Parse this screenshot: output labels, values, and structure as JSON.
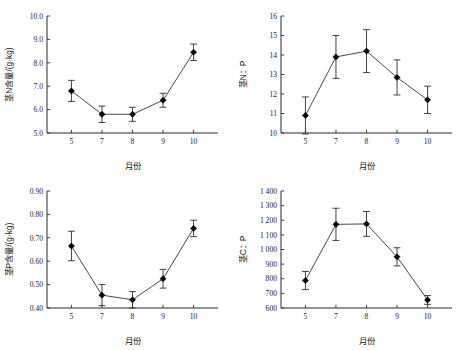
{
  "figure": {
    "title": "",
    "panel_count": 4,
    "background": "#ffffff",
    "marker_color": "#000000",
    "line_color": "#333333"
  },
  "chart_data": [
    {
      "id": "panel-1",
      "type": "line",
      "title": "",
      "xlabel": "月份",
      "ylabel": "茎N含量/(g·kg)",
      "categories": [
        "5",
        "7",
        "8",
        "9",
        "10"
      ],
      "x": [
        5,
        7,
        8,
        9,
        10
      ],
      "values": [
        6.8,
        5.8,
        5.8,
        6.4,
        8.45
      ],
      "errors": [
        0.45,
        0.35,
        0.3,
        0.3,
        0.35
      ],
      "ylim": [
        5.0,
        10.0
      ],
      "yticks": [
        5.0,
        6.0,
        7.0,
        8.0,
        9.0,
        10.0
      ],
      "ytick_labels": [
        "5.0",
        "6.0",
        "7.0",
        "8.0",
        "9.0",
        "10.0"
      ],
      "xtick_labels": [
        "5",
        "7",
        "8",
        "9",
        "10"
      ],
      "grid": false,
      "legend": "none"
    },
    {
      "id": "panel-2",
      "type": "line",
      "title": "",
      "xlabel": "月份",
      "ylabel": "茎N：P",
      "categories": [
        "5",
        "7",
        "8",
        "9",
        "10"
      ],
      "x": [
        5,
        7,
        8,
        9,
        10
      ],
      "values": [
        10.9,
        13.9,
        14.2,
        12.85,
        11.7
      ],
      "errors": [
        0.95,
        1.1,
        1.1,
        0.9,
        0.7
      ],
      "ylim": [
        10,
        16
      ],
      "yticks": [
        10,
        11,
        12,
        13,
        14,
        15,
        16
      ],
      "ytick_labels": [
        "10",
        "11",
        "12",
        "13",
        "14",
        "15",
        "16"
      ],
      "xtick_labels": [
        "5",
        "7",
        "8",
        "9",
        "10"
      ],
      "grid": false,
      "legend": "none"
    },
    {
      "id": "panel-3",
      "type": "line",
      "title": "",
      "xlabel": "月份",
      "ylabel": "茎P含量/(g·kg)",
      "categories": [
        "5",
        "7",
        "8",
        "9",
        "10"
      ],
      "x": [
        5,
        7,
        8,
        9,
        10
      ],
      "values": [
        0.665,
        0.455,
        0.435,
        0.525,
        0.74
      ],
      "errors": [
        0.063,
        0.045,
        0.035,
        0.04,
        0.035
      ],
      "ylim": [
        0.4,
        0.9
      ],
      "yticks": [
        0.4,
        0.5,
        0.6,
        0.7,
        0.8,
        0.9
      ],
      "ytick_labels": [
        "0.40",
        "0.50",
        "0.60",
        "0.70",
        "0.80",
        "0.90"
      ],
      "xtick_labels": [
        "5",
        "7",
        "8",
        "9",
        "10"
      ],
      "grid": false,
      "legend": "none"
    },
    {
      "id": "panel-4",
      "type": "line",
      "title": "",
      "xlabel": "月份",
      "ylabel": "茎C：P",
      "categories": [
        "5",
        "7",
        "8",
        "9",
        "10"
      ],
      "x": [
        5,
        7,
        8,
        9,
        10
      ],
      "values": [
        788,
        1172,
        1175,
        950,
        655
      ],
      "errors": [
        62,
        110,
        85,
        62,
        30
      ],
      "ylim": [
        600,
        1400
      ],
      "yticks": [
        600,
        700,
        800,
        900,
        1000,
        1100,
        1200,
        1300,
        1400
      ],
      "ytick_labels": [
        "600",
        "700",
        "800",
        "900",
        "1 000",
        "1 100",
        "1 200",
        "1 300",
        "1 400"
      ],
      "xtick_labels": [
        "5",
        "7",
        "8",
        "9",
        "10"
      ],
      "grid": false,
      "legend": "none"
    }
  ]
}
